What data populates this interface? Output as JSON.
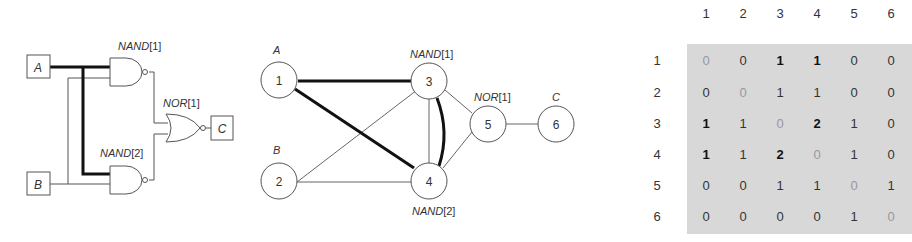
{
  "circuit": {
    "inputs": [
      {
        "label": "A"
      },
      {
        "label": "B"
      }
    ],
    "output": {
      "label": "C"
    },
    "gates": [
      {
        "label": "NAND[1]",
        "name": "NAND",
        "index": "[1]"
      },
      {
        "label": "NAND[2]",
        "name": "NAND",
        "index": "[2]"
      },
      {
        "label": "NOR[1]",
        "name": "NOR",
        "index": "[1]"
      }
    ]
  },
  "graph": {
    "nodes": [
      {
        "id": "1",
        "label": "A"
      },
      {
        "id": "2",
        "label": "B"
      },
      {
        "id": "3",
        "label": "NAND[1]",
        "name": "NAND",
        "index": "[1]"
      },
      {
        "id": "4",
        "label": "NAND[2]",
        "name": "NAND",
        "index": "[2]"
      },
      {
        "id": "5",
        "label": "NOR[1]",
        "name": "NOR",
        "index": "[1]"
      },
      {
        "id": "6",
        "label": "C"
      }
    ],
    "edges": [
      {
        "from": "1",
        "to": "3",
        "bold": true
      },
      {
        "from": "1",
        "to": "4",
        "bold": true
      },
      {
        "from": "2",
        "to": "3",
        "bold": false
      },
      {
        "from": "2",
        "to": "4",
        "bold": false
      },
      {
        "from": "3",
        "to": "4",
        "bold": false
      },
      {
        "from": "3",
        "to": "4",
        "bold": true
      },
      {
        "from": "3",
        "to": "5",
        "bold": false
      },
      {
        "from": "4",
        "to": "5",
        "bold": false
      },
      {
        "from": "5",
        "to": "6",
        "bold": false
      }
    ]
  },
  "matrix": {
    "col_headers": [
      "1",
      "2",
      "3",
      "4",
      "5",
      "6"
    ],
    "row_headers": [
      "1",
      "2",
      "3",
      "4",
      "5",
      "6"
    ],
    "rows": [
      [
        "0",
        "0",
        "1",
        "1",
        "0",
        "0"
      ],
      [
        "0",
        "0",
        "1",
        "1",
        "0",
        "0"
      ],
      [
        "1",
        "1",
        "0",
        "2",
        "1",
        "0"
      ],
      [
        "1",
        "1",
        "2",
        "0",
        "1",
        "0"
      ],
      [
        "0",
        "0",
        "1",
        "1",
        "0",
        "1"
      ],
      [
        "0",
        "0",
        "0",
        "0",
        "1",
        "0"
      ]
    ],
    "bold_cells": [
      [
        0,
        2
      ],
      [
        0,
        3
      ],
      [
        2,
        0
      ],
      [
        2,
        3
      ],
      [
        3,
        0
      ],
      [
        3,
        2
      ]
    ]
  }
}
